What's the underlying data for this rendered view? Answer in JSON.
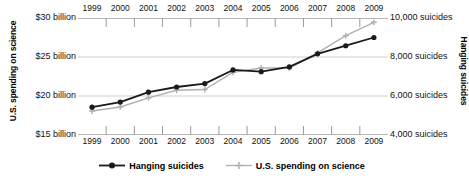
{
  "chart_data": {
    "type": "line",
    "title": "",
    "subtitle": "",
    "x": [
      1999,
      2000,
      2001,
      2002,
      2003,
      2004,
      2005,
      2006,
      2007,
      2008,
      2009
    ],
    "categories": [
      "1999",
      "2000",
      "2001",
      "2002",
      "2003",
      "2004",
      "2005",
      "2006",
      "2007",
      "2008",
      "2009"
    ],
    "xlabel": "",
    "grid": true,
    "legend_position": "bottom",
    "axes": {
      "left": {
        "label": "U.S. spending on science",
        "ticks": [
          "$30 billion",
          "$25 billion",
          "$20 billion",
          "$15 billion"
        ],
        "tick_values": [
          30,
          25,
          20,
          15
        ],
        "ylim": [
          15,
          30
        ],
        "unit": "billion USD"
      },
      "right": {
        "label": "Hanging suicides",
        "ticks": [
          "10,000 suicides",
          "8,000 suicides",
          "6,000 suicides",
          "4,000 suicides"
        ],
        "tick_values": [
          10000,
          8000,
          6000,
          4000
        ],
        "ylim": [
          4000,
          10000
        ],
        "unit": "suicides"
      }
    },
    "series": [
      {
        "name": "Hanging suicides",
        "axis": "right",
        "color": "#1a1a1a",
        "marker": "circle",
        "values": [
          5427,
          5688,
          6198,
          6462,
          6635,
          7336,
          7248,
          7491,
          8161,
          8578,
          9000
        ]
      },
      {
        "name": "U.S. spending on science",
        "axis": "left",
        "color": "#b0b0b0",
        "marker": "plus",
        "values": [
          18.079,
          18.594,
          19.753,
          20.734,
          20.831,
          23.029,
          23.597,
          23.584,
          25.525,
          27.731,
          29.449
        ]
      }
    ]
  },
  "legend": {
    "items": [
      {
        "label": "Hanging suicides",
        "color": "#1a1a1a",
        "marker": "circle"
      },
      {
        "label": "U.S. spending on science",
        "color": "#b0b0b0",
        "marker": "plus"
      }
    ]
  }
}
